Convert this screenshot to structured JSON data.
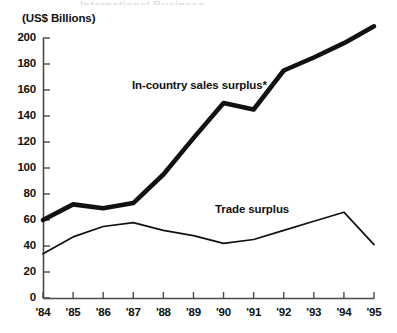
{
  "axis": {
    "unit_label": "(US$ Billions)",
    "y_ticks": [
      "0",
      "20",
      "40",
      "60",
      "80",
      "100",
      "120",
      "140",
      "160",
      "180",
      "200"
    ],
    "x_ticks": [
      "'84",
      "'85",
      "'86",
      "'87",
      "'88",
      "'89",
      "'90",
      "'91",
      "'92",
      "'93",
      "'94",
      "'95"
    ]
  },
  "annotations": {
    "thick_series": "In-country sales surplus*",
    "thin_series": "Trade surplus",
    "top_clipped": "International Business"
  },
  "colors": {
    "ink": "#111111",
    "axis": "#4a4a4a",
    "background": "#ffffff"
  },
  "chart_data": {
    "type": "line",
    "title": "",
    "subtitle": "",
    "xlabel": "",
    "ylabel": "(US$ Billions)",
    "ylim": [
      0,
      200
    ],
    "xlim": [
      "'84",
      "'95"
    ],
    "grid": false,
    "legend": "inline-annotations",
    "categories": [
      "'84",
      "'85",
      "'86",
      "'87",
      "'88",
      "'89",
      "'90",
      "'91",
      "'92",
      "'93",
      "'94",
      "'95"
    ],
    "series": [
      {
        "name": "In-country sales surplus*",
        "style": "thick",
        "values": [
          60,
          72,
          69,
          73,
          95,
          123,
          150,
          145,
          175,
          185,
          196,
          209
        ]
      },
      {
        "name": "Trade surplus",
        "style": "thin",
        "values": [
          34,
          47,
          55,
          58,
          52,
          48,
          42,
          45,
          52,
          59,
          66,
          41
        ]
      }
    ]
  }
}
